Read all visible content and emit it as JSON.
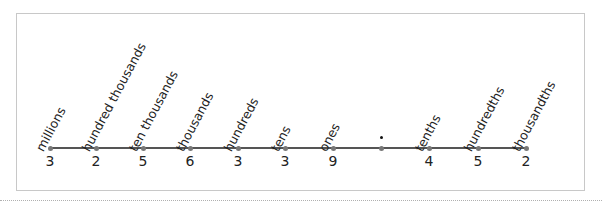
{
  "place_value_chart": {
    "places": [
      {
        "label": "millions",
        "digit": "3",
        "x": 50
      },
      {
        "label": "hundred thousands",
        "digit": "2",
        "x": 96
      },
      {
        "label": "ten thousands",
        "digit": "5",
        "x": 143
      },
      {
        "label": "thousands",
        "digit": "6",
        "x": 190
      },
      {
        "label": "hundreds",
        "digit": "3",
        "x": 238
      },
      {
        "label": "tens",
        "digit": "3",
        "x": 285
      },
      {
        "label": "ones",
        "digit": "9",
        "x": 333
      },
      {
        "label": "",
        "digit": "",
        "x": 381,
        "decimal_point": true
      },
      {
        "label": "tenths",
        "digit": "4",
        "x": 429
      },
      {
        "label": "hundredths",
        "digit": "5",
        "x": 478
      },
      {
        "label": "thousandths",
        "digit": "2",
        "x": 526
      }
    ],
    "decimal_point_symbol": "•",
    "number": "3256339.452"
  }
}
